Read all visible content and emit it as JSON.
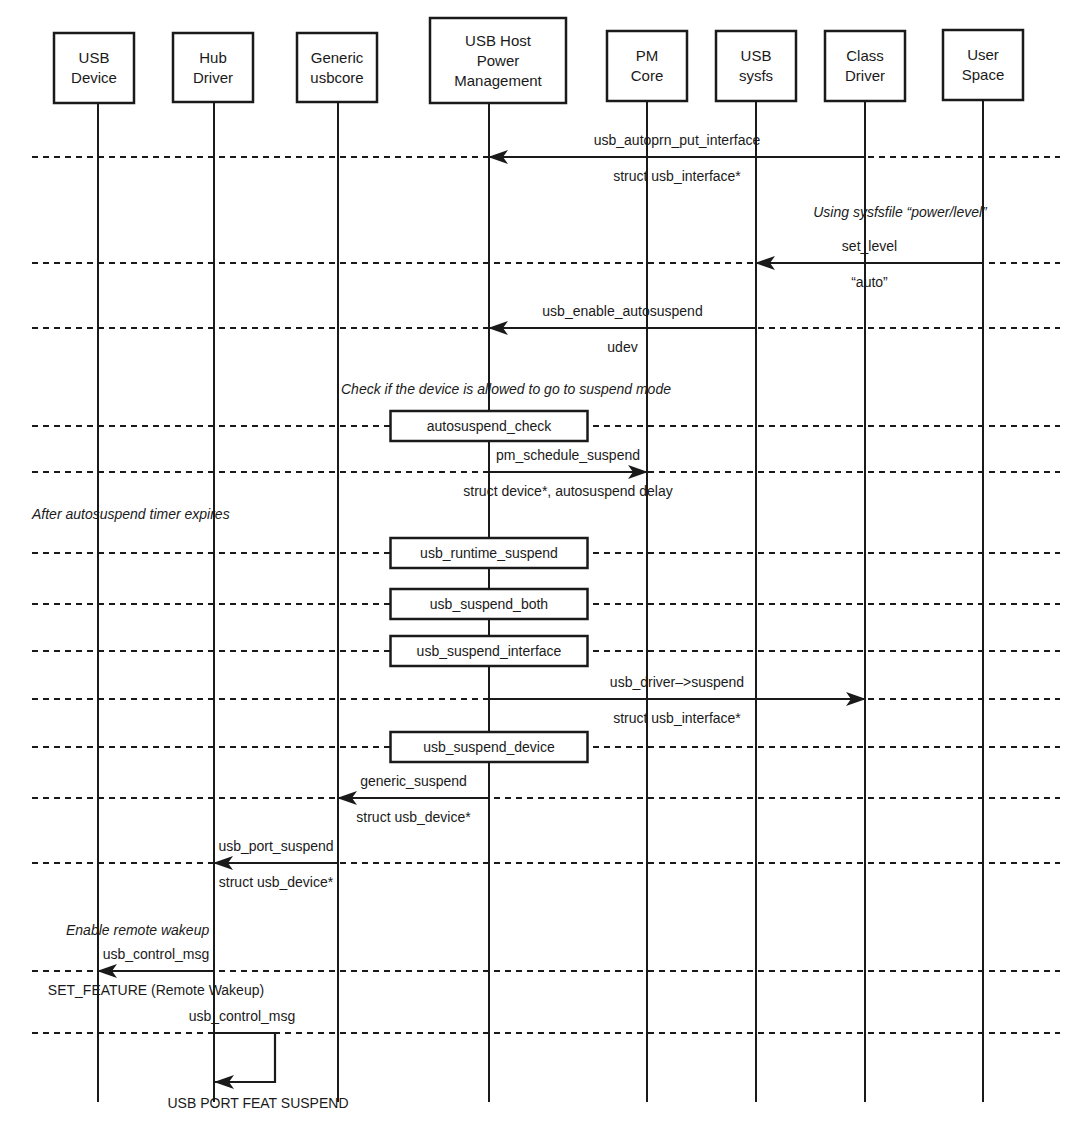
{
  "diagram": {
    "type": "sequence",
    "participants": [
      {
        "id": "usb_device",
        "lines": [
          "USB",
          "Device"
        ],
        "x": 98,
        "box": [
          54,
          33,
          134,
          103
        ]
      },
      {
        "id": "hub_driver",
        "lines": [
          "Hub",
          "Driver"
        ],
        "x": 214,
        "box": [
          173,
          33,
          253,
          102
        ]
      },
      {
        "id": "generic_usbcore",
        "lines": [
          "Generic",
          "usbcore"
        ],
        "x": 338,
        "box": [
          297,
          33,
          377,
          102
        ]
      },
      {
        "id": "usb_host_pm",
        "lines": [
          "USB Host",
          "Power",
          "Management"
        ],
        "x": 489,
        "box": [
          430,
          18,
          566,
          103
        ]
      },
      {
        "id": "pm_core",
        "lines": [
          "PM",
          "Core"
        ],
        "x": 647,
        "box": [
          607,
          31,
          687,
          101
        ]
      },
      {
        "id": "usb_sysfs",
        "lines": [
          "USB",
          "sysfs"
        ],
        "x": 756,
        "box": [
          716,
          31,
          796,
          101
        ]
      },
      {
        "id": "class_driver",
        "lines": [
          "Class",
          "Driver"
        ],
        "x": 865,
        "box": [
          825,
          31,
          905,
          101
        ]
      },
      {
        "id": "user_space",
        "lines": [
          "User",
          "Space"
        ],
        "x": 983,
        "box": [
          943,
          30,
          1023,
          100
        ]
      }
    ],
    "lifeline_bottom": 1102,
    "dashed_x": [
      32,
      1060
    ],
    "steps": [
      {
        "kind": "message",
        "y": 157,
        "from": "class_driver",
        "to": "usb_host_pm",
        "above": "usb_autoprn_put_interface",
        "below": "struct usb_interface*"
      },
      {
        "kind": "note",
        "y": 217,
        "x": 900,
        "text": "Using sysfsfile “power/level”"
      },
      {
        "kind": "message",
        "y": 263,
        "from": "user_space",
        "to": "usb_sysfs",
        "above": "set_level",
        "below": "“auto”"
      },
      {
        "kind": "message",
        "y": 328,
        "from": "usb_sysfs",
        "to": "usb_host_pm",
        "above": "usb_enable_autosuspend",
        "below": "udev"
      },
      {
        "kind": "note",
        "y": 394,
        "x": 506,
        "text": "Check if the device is allowed to go to suspend mode"
      },
      {
        "kind": "process",
        "y": 426,
        "on": "usb_host_pm",
        "text": "autosuspend_check"
      },
      {
        "kind": "message",
        "y": 472,
        "from": "usb_host_pm",
        "to": "pm_core",
        "above": "pm_schedule_suspend",
        "below": "struct device*, autosuspend delay"
      },
      {
        "kind": "note",
        "y": 519,
        "x": 32,
        "anchor": "start",
        "text": "After autosuspend timer expires"
      },
      {
        "kind": "process",
        "y": 553,
        "on": "usb_host_pm",
        "text": "usb_runtime_suspend"
      },
      {
        "kind": "process",
        "y": 604,
        "on": "usb_host_pm",
        "text": "usb_suspend_both"
      },
      {
        "kind": "process",
        "y": 651,
        "on": "usb_host_pm",
        "text": "usb_suspend_interface"
      },
      {
        "kind": "message",
        "y": 699,
        "from": "usb_host_pm",
        "to": "class_driver",
        "above": "usb_driver–>suspend",
        "below": "struct usb_interface*"
      },
      {
        "kind": "process",
        "y": 747,
        "on": "usb_host_pm",
        "text": "usb_suspend_device"
      },
      {
        "kind": "message",
        "y": 798,
        "from": "usb_host_pm",
        "to": "generic_usbcore",
        "above": "generic_suspend",
        "below": "struct usb_device*"
      },
      {
        "kind": "message",
        "y": 863,
        "from": "generic_usbcore",
        "to": "hub_driver",
        "above": "usb_port_suspend",
        "below": "struct usb_device*"
      },
      {
        "kind": "note",
        "y": 935,
        "x": 66,
        "anchor": "start",
        "text": "Enable remote wakeup"
      },
      {
        "kind": "message",
        "y": 971,
        "from": "hub_driver",
        "to": "usb_device",
        "above": "usb_control_msg",
        "below": "SET_FEATURE (Remote Wakeup)"
      },
      {
        "kind": "self",
        "y": 1033,
        "y2": 1082,
        "on": "hub_driver",
        "loop_x": 275,
        "above": "usb_control_msg",
        "below": "USB PORT FEAT SUSPEND"
      }
    ]
  }
}
